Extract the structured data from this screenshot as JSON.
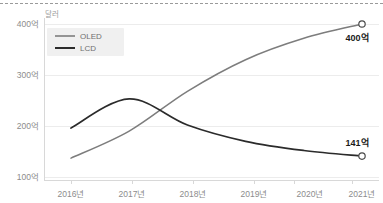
{
  "chart_data": {
    "type": "line",
    "title": "",
    "subtitle": "",
    "unit_label": "달러",
    "xlabel": "",
    "ylabel": "",
    "categories": [
      "2016년",
      "2017년",
      "2018년",
      "2019년",
      "2020년",
      "2021년"
    ],
    "ylim": [
      100,
      420
    ],
    "ytick_values": [
      100,
      200,
      300,
      400
    ],
    "ytick_labels": [
      "100억",
      "200억",
      "300억",
      "400억"
    ],
    "grid": true,
    "legend_position": "top-left-inside",
    "series": [
      {
        "name": "OLED",
        "color": "#7d7d7d",
        "values": [
          137,
          190,
          268,
          330,
          372,
          400
        ],
        "end_label": "400억"
      },
      {
        "name": "LCD",
        "color": "#2b2b2b",
        "values": [
          196,
          253,
          202,
          170,
          152,
          141
        ],
        "end_label": "141억"
      }
    ],
    "annotations": [
      {
        "text": "400억",
        "series": "OLED",
        "at_category": "2021년",
        "value": 400
      },
      {
        "text": "141억",
        "series": "LCD",
        "at_category": "2021년",
        "value": 141
      }
    ],
    "colors": {
      "oled": "#7d7d7d",
      "lcd": "#2b2b2b",
      "gridline": "#ececec",
      "axis": "#d8d8d8",
      "tick_text": "#8c8c8c",
      "legend_text": "#6f6f6f",
      "legend_background": "#f0f0f0",
      "label_text": "#1a1a1a",
      "background": "#ffffff"
    }
  },
  "legend": {
    "items": [
      {
        "label": "OLED",
        "swatch_color": "#7d7d7d"
      },
      {
        "label": "LCD",
        "swatch_color": "#2b2b2b"
      }
    ]
  },
  "axes": {
    "unit": "달러",
    "y_labels": [
      "400억",
      "300억",
      "200억",
      "100억"
    ],
    "x_labels": [
      "2016년",
      "2017년",
      "2018년",
      "2019년",
      "2020년",
      "2021년"
    ]
  },
  "endpoints": {
    "oled": "400억",
    "lcd": "141억"
  }
}
